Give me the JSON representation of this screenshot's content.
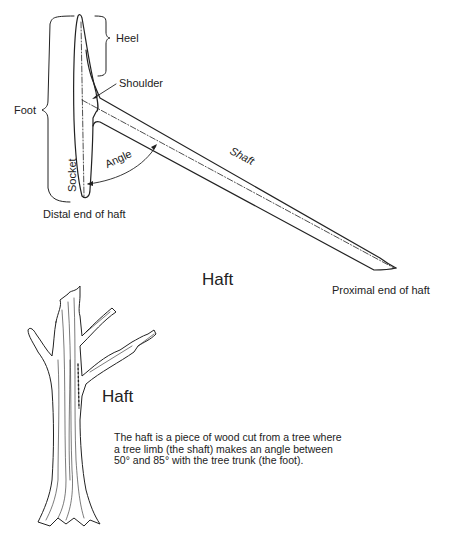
{
  "diagram": {
    "title": "Haft",
    "labels": {
      "heel": "Heel",
      "shoulder": "Shoulder",
      "foot": "Foot",
      "socket": "Socket",
      "angle": "Angle",
      "shaft": "Shaft",
      "distal_end": "Distal end of haft",
      "proximal_end": "Proximal end of haft"
    }
  },
  "tree_illustration": {
    "label": "Haft",
    "caption_lines": [
      "The haft is a piece of wood cut from a tree where",
      "a tree limb (the shaft) makes an angle between",
      "50° and 85° with the tree trunk (the foot)."
    ]
  }
}
